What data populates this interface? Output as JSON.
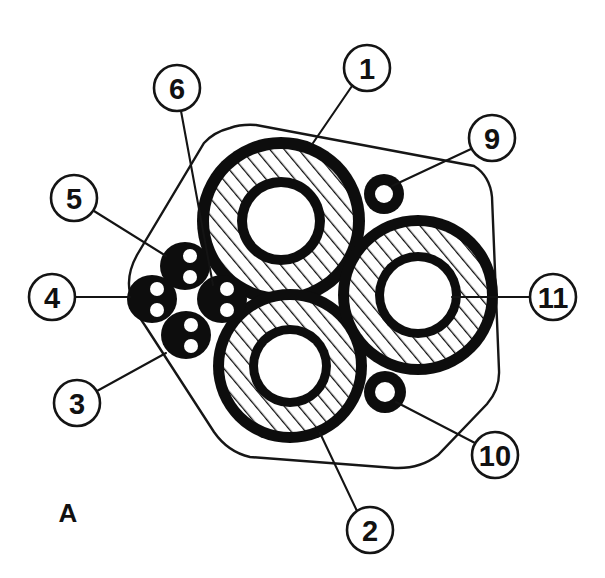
{
  "figure": {
    "panel_label": "A",
    "panel_label_x": 68,
    "panel_label_y": 513,
    "background_color": "#ffffff",
    "ink_color": "#111111",
    "line_color": "#141414"
  },
  "boundary": {
    "name": "specimen-outline",
    "description": "rounded quadrilateral cross-section boundary",
    "stroke_color": "#161616",
    "fill_color": "#ffffff",
    "path": "M 230 128 Q 214 132 204 143 L 137 255 Q 126 275 130 293 Q 134 311 146 327 L 214 432 Q 228 452 250 457 L 395 468 Q 420 469 438 455 L 487 404 Q 500 389 499 370 L 492 197 Q 490 176 474 166 L 256 125 Q 241 124 230 128 Z"
  },
  "large_rings": [
    {
      "id": "ring-1",
      "callout": "1",
      "cx": 281,
      "cy": 221,
      "r_outer": 84,
      "r_outer_inner": 72,
      "r_hatch_inner": 44,
      "r_wall_inner": 34,
      "fill_pattern": "diagonal-hatch",
      "outer_ring_color": "#0d0d0d",
      "lumen_color": "#ffffff"
    },
    {
      "id": "ring-2",
      "callout": "2",
      "cx": 290,
      "cy": 366,
      "r_outer": 77,
      "r_outer_inner": 66,
      "r_hatch_inner": 41,
      "r_wall_inner": 32,
      "fill_pattern": "diagonal-hatch",
      "outer_ring_color": "#0d0d0d",
      "lumen_color": "#ffffff"
    },
    {
      "id": "ring-11",
      "callout": "11",
      "cx": 418,
      "cy": 295,
      "r_outer": 80,
      "r_outer_inner": 69,
      "r_hatch_inner": 43,
      "r_wall_inner": 34,
      "fill_pattern": "diagonal-hatch",
      "outer_ring_color": "#0d0d0d",
      "lumen_color": "#ffffff"
    }
  ],
  "small_rings": [
    {
      "id": "small-ring-9",
      "callout": "9",
      "cx": 384,
      "cy": 194,
      "r_outer": 20,
      "r_inner": 9,
      "body_color": "#0d0d0d",
      "lumen_color": "#ffffff"
    },
    {
      "id": "small-ring-10",
      "callout": "10",
      "cx": 385,
      "cy": 392,
      "r_outer": 21,
      "r_inner": 10,
      "body_color": "#0d0d0d",
      "lumen_color": "#ffffff"
    }
  ],
  "blobs": [
    {
      "id": "blob-5",
      "callout": "5",
      "cx": 185,
      "cy": 266,
      "rx": 25,
      "ry": 24,
      "dots": [
        {
          "cx": 190,
          "cy": 256,
          "r": 7
        },
        {
          "cx": 190,
          "cy": 277,
          "r": 7
        }
      ],
      "body_color": "#0d0d0d",
      "dot_color": "#ffffff"
    },
    {
      "id": "blob-4",
      "callout": "4",
      "cx": 152,
      "cy": 299,
      "rx": 25,
      "ry": 24,
      "dots": [
        {
          "cx": 157,
          "cy": 289,
          "r": 7
        },
        {
          "cx": 157,
          "cy": 310,
          "r": 7
        }
      ],
      "body_color": "#0d0d0d",
      "dot_color": "#ffffff"
    },
    {
      "id": "blob-6",
      "callout": "6",
      "cx": 222,
      "cy": 299,
      "rx": 25,
      "ry": 24,
      "dots": [
        {
          "cx": 227,
          "cy": 289,
          "r": 7
        },
        {
          "cx": 227,
          "cy": 310,
          "r": 7
        }
      ],
      "body_color": "#0d0d0d",
      "dot_color": "#ffffff"
    },
    {
      "id": "blob-3",
      "callout": "3",
      "cx": 186,
      "cy": 335,
      "rx": 25,
      "ry": 24,
      "dots": [
        {
          "cx": 191,
          "cy": 325,
          "r": 7
        },
        {
          "cx": 191,
          "cy": 346,
          "r": 7
        }
      ],
      "body_color": "#0d0d0d",
      "dot_color": "#ffffff"
    }
  ],
  "callouts": [
    {
      "id": "callout-1",
      "label": "1",
      "cx": 367,
      "cy": 68,
      "r": 23,
      "leader": {
        "x1": 352,
        "y1": 86,
        "x2": 313,
        "y2": 143
      }
    },
    {
      "id": "callout-2",
      "label": "2",
      "cx": 370,
      "cy": 530,
      "r": 23,
      "leader": {
        "x1": 357,
        "y1": 511,
        "x2": 320,
        "y2": 433
      }
    },
    {
      "id": "callout-3",
      "label": "3",
      "cx": 77,
      "cy": 403,
      "r": 23,
      "leader": {
        "x1": 97,
        "y1": 391,
        "x2": 166,
        "y2": 353
      }
    },
    {
      "id": "callout-4",
      "label": "4",
      "cx": 52,
      "cy": 297,
      "r": 23,
      "leader": {
        "x1": 75,
        "y1": 297,
        "x2": 130,
        "y2": 297
      }
    },
    {
      "id": "callout-5",
      "label": "5",
      "cx": 74,
      "cy": 198,
      "r": 23,
      "leader": {
        "x1": 94,
        "y1": 211,
        "x2": 166,
        "y2": 256
      }
    },
    {
      "id": "callout-6",
      "label": "6",
      "cx": 177,
      "cy": 88,
      "r": 23,
      "leader": {
        "x1": 181,
        "y1": 111,
        "x2": 213,
        "y2": 285
      }
    },
    {
      "id": "callout-9",
      "label": "9",
      "cx": 492,
      "cy": 138,
      "r": 23,
      "leader": {
        "x1": 471,
        "y1": 149,
        "x2": 392,
        "y2": 186
      }
    },
    {
      "id": "callout-10",
      "label": "10",
      "cx": 495,
      "cy": 455,
      "r": 23,
      "leader": {
        "x1": 475,
        "y1": 443,
        "x2": 396,
        "y2": 402
      }
    },
    {
      "id": "callout-11",
      "label": "11",
      "cx": 553,
      "cy": 297,
      "r": 23,
      "leader": {
        "x1": 530,
        "y1": 297,
        "x2": 452,
        "y2": 297
      }
    }
  ]
}
